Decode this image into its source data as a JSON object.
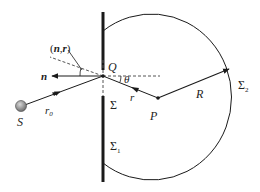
{
  "diagram": {
    "type": "kirchhoff-diffraction-geometry",
    "colors": {
      "line": "#1a1a1a",
      "dashed": "#555555",
      "source_fill": "#8a8a8a",
      "background": "#ffffff"
    },
    "labels": {
      "nr_angle": "(n,r)",
      "normal": "n",
      "point_q": "Q",
      "theta": "θ",
      "r": "r",
      "r0": "r",
      "r0_sub": "0",
      "sigma": "Σ",
      "sigma1": "Σ",
      "sigma1_sub": "1",
      "sigma2": "Σ",
      "sigma2_sub": "2",
      "point_p": "P",
      "radius": "R",
      "source": "S"
    }
  }
}
